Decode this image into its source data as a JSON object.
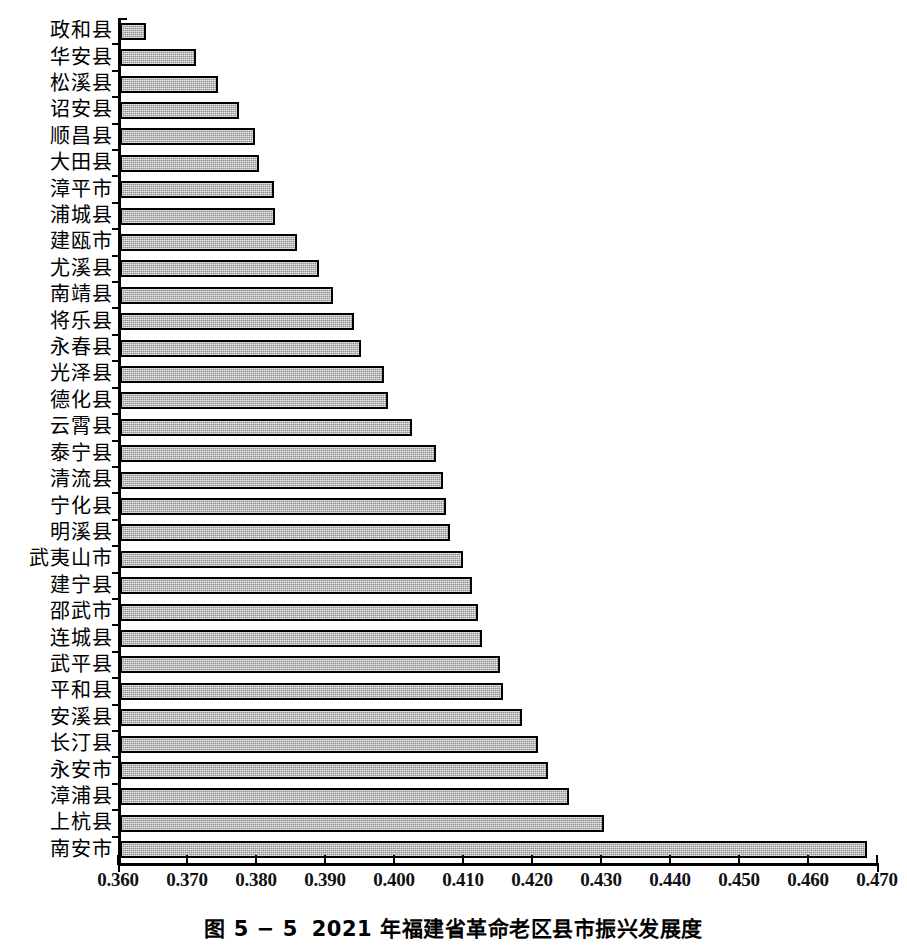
{
  "figure": {
    "caption_number": "图 5 − 5",
    "caption_text": "2021 年福建省革命老区县市振兴发展度"
  },
  "chart_data": {
    "type": "bar",
    "orientation": "horizontal",
    "xlabel": "",
    "ylabel": "",
    "xlim": [
      0.36,
      0.47
    ],
    "xticks": [
      "0.360",
      "0.370",
      "0.380",
      "0.390",
      "0.400",
      "0.410",
      "0.420",
      "0.430",
      "0.440",
      "0.450",
      "0.460",
      "0.470"
    ],
    "xtick_values": [
      0.36,
      0.37,
      0.38,
      0.39,
      0.4,
      0.41,
      0.42,
      0.43,
      0.44,
      0.45,
      0.46,
      0.47
    ],
    "grid": false,
    "legend": null,
    "bar_fill_color": "#8f8f8f",
    "bar_border_color": "#000000",
    "categories": [
      "政和县",
      "华安县",
      "松溪县",
      "诏安县",
      "顺昌县",
      "大田县",
      "漳平市",
      "浦城县",
      "建瓯市",
      "尤溪县",
      "南靖县",
      "将乐县",
      "永春县",
      "光泽县",
      "德化县",
      "云霄县",
      "泰宁县",
      "清流县",
      "宁化县",
      "明溪县",
      "武夷山市",
      "建宁县",
      "邵武市",
      "连城县",
      "武平县",
      "平和县",
      "安溪县",
      "长汀县",
      "永安市",
      "漳浦县",
      "上杭县",
      "南安市"
    ],
    "values": [
      0.364,
      0.3713,
      0.3745,
      0.3776,
      0.3799,
      0.3804,
      0.3826,
      0.3828,
      0.386,
      0.3891,
      0.3911,
      0.3942,
      0.3952,
      0.3985,
      0.3991,
      0.4026,
      0.4061,
      0.4071,
      0.4075,
      0.4081,
      0.41,
      0.4113,
      0.4122,
      0.4128,
      0.4153,
      0.4158,
      0.4185,
      0.4208,
      0.4223,
      0.4254,
      0.4305,
      0.4686
    ],
    "series": [
      {
        "name": "振兴发展度",
        "values": [
          0.364,
          0.3713,
          0.3745,
          0.3776,
          0.3799,
          0.3804,
          0.3826,
          0.3828,
          0.386,
          0.3891,
          0.3911,
          0.3942,
          0.3952,
          0.3985,
          0.3991,
          0.4026,
          0.4061,
          0.4071,
          0.4075,
          0.4081,
          0.41,
          0.4113,
          0.4122,
          0.4128,
          0.4153,
          0.4158,
          0.4185,
          0.4208,
          0.4223,
          0.4254,
          0.4305,
          0.4686
        ]
      }
    ]
  }
}
